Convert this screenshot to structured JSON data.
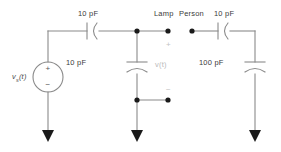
{
  "diagram": {
    "colors": {
      "wire": "#8a8a8a",
      "node": "#1a1a1a",
      "text": "#3a3a3a",
      "text_faint": "#b9b9b9",
      "background": "#ffffff"
    },
    "source": {
      "label": "v",
      "label_sub": "s",
      "label_tail": "(t)",
      "plus": "+",
      "minus": "−"
    },
    "components": {
      "c_series_left": "10 pF",
      "c_shunt_middle": "10 pF",
      "c_series_right": "10 pF",
      "c_shunt_right": "100 pF"
    },
    "terminals": {
      "lamp": "Lamp",
      "person": "Person"
    },
    "output": {
      "label": "v(t)",
      "plus": "+",
      "minus": "−"
    }
  }
}
